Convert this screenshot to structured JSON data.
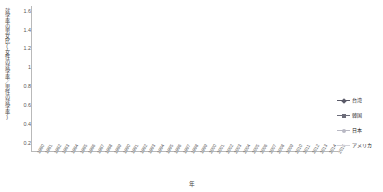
{
  "chart_data": {
    "type": "line",
    "title": "",
    "xlabel": "年",
    "ylabel": "就学率の男女比(女性の就学率／男性の就学率)",
    "ylim": [
      0.1,
      1.65
    ],
    "yticks": [
      1.6,
      1.4,
      1.2,
      1,
      0.8,
      0.6,
      0.4,
      0.2
    ],
    "ytick_labels": [
      "1.6",
      "1.4",
      "1.2",
      "1",
      "0.8",
      "0.6",
      "0.4",
      "0.2"
    ],
    "grid": false,
    "legend_position": "right",
    "categories": [
      "1980",
      "1981",
      "1982",
      "1983",
      "1984",
      "1985",
      "1986",
      "1987",
      "1988",
      "1989",
      "1990",
      "1991",
      "1992",
      "1993",
      "1994",
      "1995",
      "1996",
      "1997",
      "1998",
      "1999",
      "2000",
      "2001",
      "2002",
      "2003",
      "2004",
      "2005",
      "2006",
      "2007",
      "2008",
      "2009",
      "2010",
      "2011",
      "2012",
      "2013",
      "2014",
      "2015"
    ],
    "series": [
      {
        "name": "台湾",
        "color": "#5a5a68",
        "marker": "diamond",
        "values": [
          0.78,
          0.79,
          0.81,
          0.83,
          0.85,
          0.87,
          0.88,
          0.88,
          0.9,
          0.92,
          0.94,
          0.96,
          0.98,
          0.99,
          0.99,
          0.99,
          1.0,
          1.04,
          1.09,
          1.13,
          1.15,
          1.16,
          1.15,
          1.13,
          1.12,
          1.12,
          1.13,
          1.13,
          1.11,
          1.09,
          1.09,
          1.1,
          1.11,
          1.11,
          1.12,
          1.13
        ]
      },
      {
        "name": "韓国",
        "color": "#6d6d7a",
        "marker": "square",
        "values": [
          0.33,
          0.35,
          0.37,
          0.39,
          0.41,
          0.43,
          0.48,
          0.45,
          0.44,
          0.44,
          0.44,
          0.45,
          0.45,
          0.46,
          0.46,
          0.49,
          0.53,
          0.52,
          0.52,
          0.52,
          0.55,
          0.53,
          0.54,
          0.55,
          0.56,
          0.57,
          0.59,
          0.6,
          0.62,
          0.64,
          0.66,
          0.69,
          0.72,
          0.74,
          0.76,
          0.78
        ]
      },
      {
        "name": "日本",
        "color": "#b9b9c4",
        "marker": "circle",
        "values": [
          0.45,
          0.46,
          0.47,
          0.48,
          0.49,
          0.5,
          0.52,
          0.53,
          0.54,
          0.55,
          0.57,
          0.58,
          0.6,
          0.62,
          0.67,
          0.72,
          0.76,
          0.78,
          0.79,
          0.8,
          0.81,
          0.81,
          0.82,
          0.82,
          0.82,
          0.82,
          0.83,
          0.83,
          0.84,
          0.84,
          0.85,
          0.86,
          0.87,
          0.88,
          0.89,
          0.91
        ]
      },
      {
        "name": "アメリカ",
        "color": "#d2d2d8",
        "marker": "none",
        "values": [
          1.07,
          1.09,
          1.11,
          1.13,
          1.14,
          1.15,
          1.16,
          1.17,
          1.19,
          1.21,
          1.23,
          1.25,
          1.26,
          1.26,
          1.27,
          1.27,
          1.28,
          1.29,
          1.3,
          1.31,
          1.33,
          1.35,
          1.37,
          1.38,
          1.39,
          1.4,
          1.41,
          1.42,
          1.42,
          1.41,
          1.41,
          1.4,
          1.4,
          1.39,
          1.39,
          1.38
        ]
      }
    ]
  }
}
